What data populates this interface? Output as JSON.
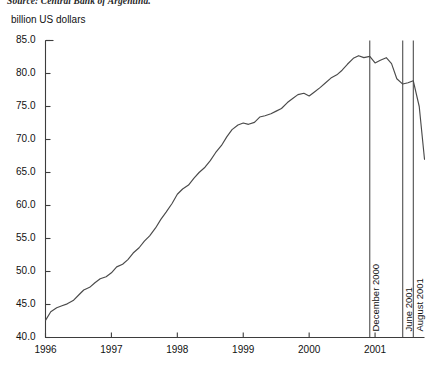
{
  "chart_data": {
    "type": "line",
    "title": "",
    "source_note": "Source: Central Bank of Argentina.",
    "ylabel": "billion US dollars",
    "xlabel": "",
    "ylim": [
      40.0,
      85.0
    ],
    "ytick_step": 5.0,
    "yticks": [
      "40.0",
      "45.0",
      "50.0",
      "55.0",
      "60.0",
      "65.0",
      "70.0",
      "75.0",
      "80.0",
      "85.0"
    ],
    "xlim": [
      1996.0,
      2001.75
    ],
    "xticks": [
      "1996",
      "1997",
      "1998",
      "1999",
      "2000",
      "2001"
    ],
    "xtick_values": [
      1996,
      1997,
      1998,
      1999,
      2000,
      2001
    ],
    "grid": false,
    "legend": false,
    "series": [
      {
        "name": "Deposits in the Argentine banking system",
        "x": [
          1996.0,
          1996.08,
          1996.17,
          1996.25,
          1996.33,
          1996.42,
          1996.5,
          1996.58,
          1996.67,
          1996.75,
          1996.83,
          1996.92,
          1997.0,
          1997.08,
          1997.17,
          1997.25,
          1997.33,
          1997.42,
          1997.5,
          1997.58,
          1997.67,
          1997.75,
          1997.83,
          1997.92,
          1998.0,
          1998.08,
          1998.17,
          1998.25,
          1998.33,
          1998.42,
          1998.5,
          1998.58,
          1998.67,
          1998.75,
          1998.83,
          1998.92,
          1999.0,
          1999.08,
          1999.17,
          1999.25,
          1999.33,
          1999.42,
          1999.5,
          1999.58,
          1999.67,
          1999.75,
          1999.83,
          1999.92,
          2000.0,
          2000.08,
          2000.17,
          2000.25,
          2000.33,
          2000.42,
          2000.5,
          2000.58,
          2000.67,
          2000.75,
          2000.83,
          2000.92,
          2001.0,
          2001.08,
          2001.17,
          2001.25,
          2001.33,
          2001.42,
          2001.5,
          2001.58,
          2001.67,
          2001.75
        ],
        "values": [
          42.6,
          43.9,
          44.5,
          44.8,
          45.1,
          45.6,
          46.4,
          47.2,
          47.6,
          48.3,
          48.9,
          49.2,
          49.8,
          50.7,
          51.1,
          51.8,
          52.8,
          53.6,
          54.6,
          55.4,
          56.6,
          57.9,
          59.0,
          60.3,
          61.7,
          62.5,
          63.1,
          64.1,
          65.0,
          65.8,
          66.8,
          68.0,
          69.1,
          70.4,
          71.5,
          72.2,
          72.5,
          72.3,
          72.6,
          73.4,
          73.6,
          73.9,
          74.3,
          74.7,
          75.6,
          76.2,
          76.8,
          77.0,
          76.6,
          77.2,
          77.9,
          78.6,
          79.3,
          79.8,
          80.5,
          81.4,
          82.3,
          82.7,
          82.4,
          82.6,
          81.6,
          82.0,
          82.4,
          81.5,
          79.2,
          78.4,
          78.6,
          78.9,
          75.0,
          67.0
        ]
      }
    ],
    "annotations": [
      {
        "label": "December 2000",
        "x": 2000.92,
        "name": "december-2000"
      },
      {
        "label": "June 2001",
        "x": 2001.42,
        "name": "june-2001"
      },
      {
        "label": "August 2001",
        "x": 2001.58,
        "name": "august-2001"
      }
    ]
  }
}
